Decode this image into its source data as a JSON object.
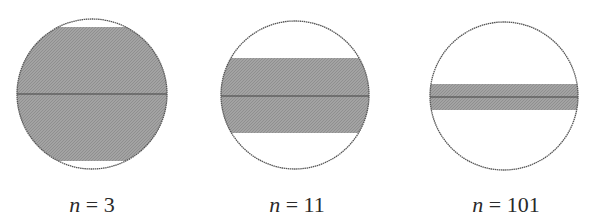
{
  "figure": {
    "colors": {
      "background": "#ffffff",
      "circle_stroke": "#555555",
      "band_fill": "#9a9a9a",
      "midline": "#444444",
      "label": "#2a2a2a"
    },
    "panels": [
      {
        "var": "n",
        "eq": "=",
        "value": "3",
        "circle": {
          "cx": 92,
          "cy": 94,
          "r": 75
        },
        "band": {
          "top": 27,
          "bottom": 161
        },
        "midline_y": 94,
        "label_center_x": 92
      },
      {
        "var": "n",
        "eq": "=",
        "value": "11",
        "circle": {
          "cx": 295,
          "cy": 95,
          "r": 74
        },
        "band": {
          "top": 58,
          "bottom": 133
        },
        "midline_y": 96,
        "label_center_x": 297
      },
      {
        "var": "n",
        "eq": "=",
        "value": "101",
        "circle": {
          "cx": 504,
          "cy": 96,
          "r": 74
        },
        "band": {
          "top": 84,
          "bottom": 110
        },
        "midline_y": 97,
        "label_center_x": 506
      }
    ]
  }
}
